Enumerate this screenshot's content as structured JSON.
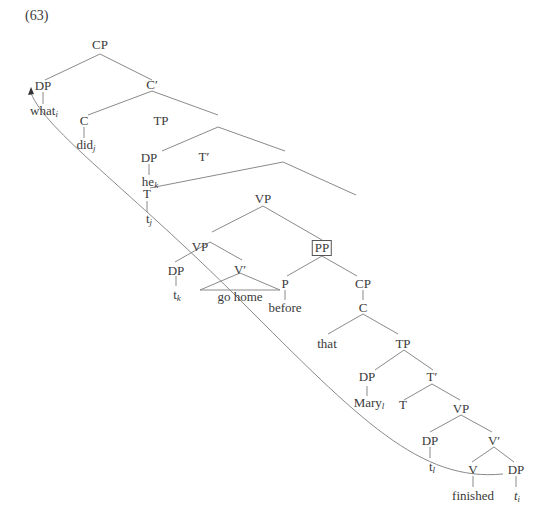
{
  "example_number": "(63)",
  "nodes": {
    "cp_root": "CP",
    "dp_what": "DP",
    "what": "what",
    "what_idx": "i",
    "c_bar": "C′",
    "c": "C",
    "did": "did",
    "did_idx": "j",
    "tp": "TP",
    "dp_he": "DP",
    "he": "he",
    "he_idx": "k",
    "t_bar": "T′",
    "t": "T",
    "t_trace": "t",
    "t_trace_idx": "j",
    "vp_upper": "VP",
    "vp_lower": "VP",
    "pp": "PP",
    "dp_tk": "DP",
    "tk": "t",
    "tk_idx": "k",
    "v_bar_go": "V′",
    "go_home": "go home",
    "p": "P",
    "before": "before",
    "cp_embedded": "CP",
    "c_embedded": "C",
    "that": "that",
    "tp_embedded": "TP",
    "dp_mary": "DP",
    "mary": "Mary",
    "mary_idx": "l",
    "t_bar_embedded": "T′",
    "t_embedded": "T",
    "vp_embedded": "VP",
    "dp_tl": "DP",
    "tl": "t",
    "tl_idx": "l",
    "v_bar_embedded": "V′",
    "v": "V",
    "finished": "finished",
    "dp_object": "DP",
    "ti": "t",
    "ti_idx": "i"
  },
  "annotations": {
    "boxed_node": "PP",
    "movement_arrow": "from t_i (object of finished) to what_i (spec CP)"
  }
}
